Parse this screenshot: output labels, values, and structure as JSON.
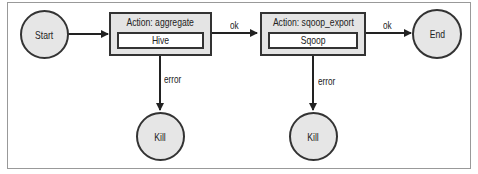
{
  "diagram": {
    "nodes": {
      "start": {
        "label": "Start"
      },
      "end": {
        "label": "End"
      },
      "kill1": {
        "label": "Kill"
      },
      "kill2": {
        "label": "Kill"
      }
    },
    "actions": [
      {
        "title": "Action: aggregate",
        "type": "Hive"
      },
      {
        "title": "Action: sqoop_export",
        "type": "Sqoop"
      }
    ],
    "edges": [
      {
        "from": "start",
        "to": "aggregate",
        "label": ""
      },
      {
        "from": "aggregate",
        "to": "sqoop_export",
        "label": "ok"
      },
      {
        "from": "sqoop_export",
        "to": "end",
        "label": "ok"
      },
      {
        "from": "aggregate",
        "to": "kill1",
        "label": "error"
      },
      {
        "from": "sqoop_export",
        "to": "kill2",
        "label": "error"
      }
    ],
    "colors": {
      "node_fill": "#e6e6e6",
      "stroke": "#333333"
    }
  }
}
